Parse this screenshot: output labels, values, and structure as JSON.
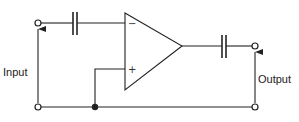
{
  "diagram": {
    "type": "op-amp capacitor-coupled amplifier circuit",
    "labels": {
      "input": "Input",
      "output": "Output",
      "inverting": "−",
      "non_inverting": "+"
    },
    "components": [
      {
        "id": "input-terminal-top",
        "kind": "terminal"
      },
      {
        "id": "input-terminal-bottom",
        "kind": "terminal"
      },
      {
        "id": "input-capacitor",
        "kind": "capacitor"
      },
      {
        "id": "op-amp",
        "kind": "operational amplifier"
      },
      {
        "id": "output-capacitor",
        "kind": "capacitor"
      },
      {
        "id": "output-terminal-top",
        "kind": "terminal"
      },
      {
        "id": "output-terminal-bottom",
        "kind": "terminal"
      },
      {
        "id": "ground-junction",
        "kind": "junction"
      }
    ],
    "colors": {
      "line": "#222222",
      "background": "#ffffff"
    }
  }
}
